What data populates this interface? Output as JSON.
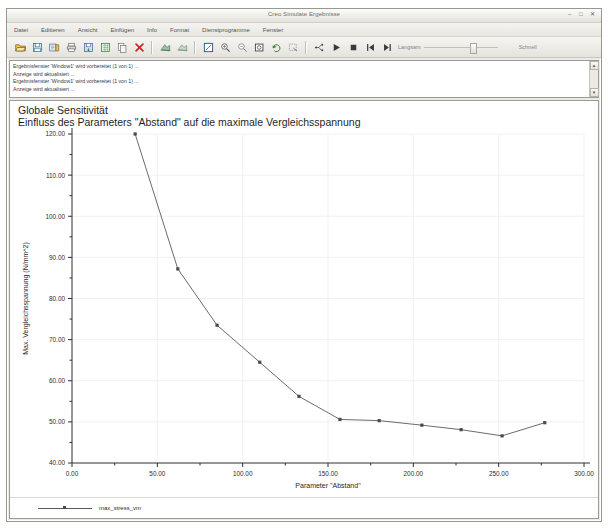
{
  "window": {
    "title": "Creo Simulate Ergebnisse",
    "controls": [
      {
        "name": "minimize",
        "glyph": "–"
      },
      {
        "name": "maximize",
        "glyph": "□"
      },
      {
        "name": "close",
        "glyph": "✕"
      }
    ]
  },
  "menu": {
    "items": [
      {
        "label": "Datei"
      },
      {
        "label": "Editieren"
      },
      {
        "label": "Ansicht"
      },
      {
        "label": "Einfügen"
      },
      {
        "label": "Info"
      },
      {
        "label": "Format"
      },
      {
        "label": "Dienstprogramme"
      },
      {
        "label": "Fenster"
      }
    ]
  },
  "toolbar": {
    "buttons": [
      {
        "name": "open-icon"
      },
      {
        "name": "save-icon"
      },
      {
        "name": "save-copy-icon"
      },
      {
        "name": "print-icon"
      },
      {
        "name": "export-icon"
      },
      {
        "name": "excel-export-icon"
      },
      {
        "name": "copy-icon"
      },
      {
        "name": "delete-icon"
      },
      {
        "name": "show-result-window-icon"
      },
      {
        "name": "hide-result-window-icon"
      },
      {
        "name": "full-view-icon"
      },
      {
        "name": "zoom-in-icon"
      },
      {
        "name": "zoom-out-icon"
      },
      {
        "name": "zoom-box-icon"
      },
      {
        "name": "repaint-icon"
      },
      {
        "name": "query-icon"
      },
      {
        "name": "animate-branch-icon"
      },
      {
        "name": "play-icon"
      },
      {
        "name": "stop-icon"
      },
      {
        "name": "first-frame-icon"
      },
      {
        "name": "next-frame-icon"
      }
    ],
    "speed_slider": {
      "slow_label": "Langsam",
      "fast_label": "Schnell",
      "value_percent": 62
    }
  },
  "message_log": {
    "lines": [
      "Ergebnisfenster 'Window1' wird vorbereitet (1 von 1) ...",
      "Anzeige wird aktualisiert ...",
      "Ergebnisfenster 'Window1' wird vorbereitet (1 von 1) ...",
      "Anzeige wird aktualisiert ..."
    ],
    "scroll_up": "▲",
    "scroll_down": "▼"
  },
  "chart_data": {
    "type": "line",
    "title": "Globale Sensitivität",
    "subtitle": "Einfluss des Parameters \"Abstand\" auf die maximale Vergleichsspannung",
    "xlabel": "Parameter \"Abstand\"",
    "ylabel": "Max. Vergleichsspannung (N/mm^2)",
    "xlim": [
      0,
      300
    ],
    "ylim": [
      40,
      120
    ],
    "xticks": [
      0,
      50,
      100,
      150,
      200,
      250,
      300
    ],
    "xtick_labels": [
      "0.00",
      "50.00",
      "100.00",
      "150.00",
      "200.00",
      "250.00",
      "300.00"
    ],
    "yticks": [
      40,
      50,
      60,
      70,
      80,
      90,
      100,
      110,
      120
    ],
    "ytick_labels": [
      "40.00",
      "50.00",
      "60.00",
      "70.00",
      "80.00",
      "90.00",
      "100.00",
      "110.00",
      "120.00"
    ],
    "minor_ticks": true,
    "grid": true,
    "legend_position": "bottom-left",
    "series": [
      {
        "name": "max_stress_vm",
        "x": [
          37,
          62,
          85,
          110,
          133,
          157,
          180,
          205,
          228,
          252,
          277
        ],
        "y": [
          120.0,
          87.2,
          73.5,
          64.5,
          56.2,
          50.6,
          50.3,
          49.2,
          48.1,
          46.6,
          49.8
        ]
      }
    ]
  }
}
